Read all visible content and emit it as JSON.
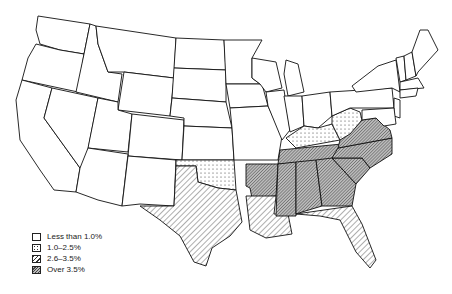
{
  "map": {
    "subject": "United States (contiguous states) by percentage category",
    "legend": [
      {
        "key": "lt1",
        "label": "Less than 1.0%",
        "pattern": "blank"
      },
      {
        "key": "1to25",
        "label": "1.0–2.5%",
        "pattern": "dots"
      },
      {
        "key": "26to35",
        "label": "2.6–3.5%",
        "pattern": "diagonal-lines"
      },
      {
        "key": "gt35",
        "label": "Over 3.5%",
        "pattern": "dense-hatch"
      }
    ],
    "categories": {
      "Over 3.5%": [
        "Arkansas",
        "Tennessee",
        "Mississippi",
        "Alabama",
        "Georgia",
        "South Carolina",
        "North Carolina",
        "Virginia"
      ],
      "2.6–3.5%": [
        "Texas",
        "Louisiana",
        "Florida"
      ],
      "1.0–2.5%": [
        "Oklahoma",
        "Kentucky",
        "West Virginia"
      ],
      "Less than 1.0%": [
        "All other states"
      ]
    }
  }
}
